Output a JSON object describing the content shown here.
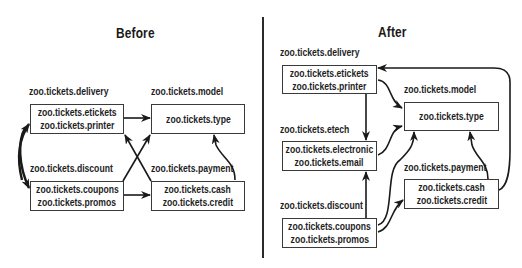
{
  "before": {
    "title": "Before",
    "packages": {
      "delivery": {
        "label": "zoo.tickets.delivery",
        "classes": [
          "zoo.tickets.etickets",
          "zoo.tickets.printer"
        ]
      },
      "model": {
        "label": "zoo.tickets.model",
        "classes": [
          "zoo.tickets.type"
        ]
      },
      "discount": {
        "label": "zoo.tickets.discount",
        "classes": [
          "zoo.tickets.coupons",
          "zoo.tickets.promos"
        ]
      },
      "payment": {
        "label": "zoo.tickets.payment",
        "classes": [
          "zoo.tickets.cash",
          "zoo.tickets.credit"
        ]
      }
    },
    "dependencies": [
      {
        "from": "delivery",
        "to": "model"
      },
      {
        "from": "delivery",
        "to": "discount"
      },
      {
        "from": "discount",
        "to": "delivery"
      },
      {
        "from": "discount",
        "to": "payment"
      },
      {
        "from": "discount",
        "to": "model"
      },
      {
        "from": "payment",
        "to": "delivery"
      },
      {
        "from": "payment",
        "to": "model"
      }
    ]
  },
  "after": {
    "title": "After",
    "packages": {
      "delivery": {
        "label": "zoo.tickets.delivery",
        "classes": [
          "zoo.tickets.etickets",
          "zoo.tickets.printer"
        ]
      },
      "model": {
        "label": "zoo.tickets.model",
        "classes": [
          "zoo.tickets.type"
        ]
      },
      "etech": {
        "label": "zoo.tickets.etech",
        "classes": [
          "zoo.tickets.electronic",
          "zoo.tickets.email"
        ]
      },
      "payment": {
        "label": "zoo.tickets.payment",
        "classes": [
          "zoo.tickets.cash",
          "zoo.tickets.credit"
        ]
      },
      "discount": {
        "label": "zoo.tickets.discount",
        "classes": [
          "zoo.tickets.coupons",
          "zoo.tickets.promos"
        ]
      }
    },
    "dependencies": [
      {
        "from": "delivery",
        "to": "model"
      },
      {
        "from": "delivery",
        "to": "etech"
      },
      {
        "from": "etech",
        "to": "model"
      },
      {
        "from": "discount",
        "to": "etech"
      },
      {
        "from": "discount",
        "to": "model"
      },
      {
        "from": "discount",
        "to": "payment"
      },
      {
        "from": "payment",
        "to": "model"
      },
      {
        "from": "payment",
        "to": "delivery"
      }
    ]
  },
  "colors": {
    "line": "#1a1a1a",
    "box_border": "#3a3a3a",
    "background": "#ffffff"
  }
}
